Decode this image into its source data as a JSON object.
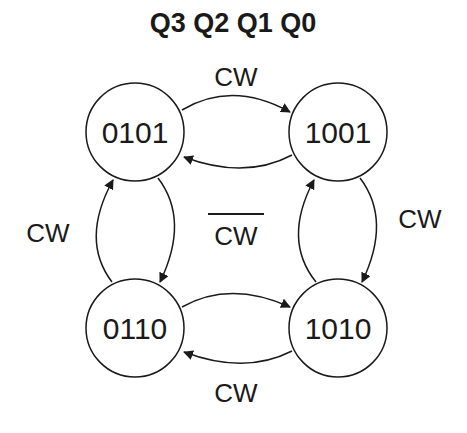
{
  "title": "Q3 Q2 Q1 Q0",
  "states": [
    {
      "id": "s0101",
      "label": "0101"
    },
    {
      "id": "s1001",
      "label": "1001"
    },
    {
      "id": "s0110",
      "label": "0110"
    },
    {
      "id": "s1010",
      "label": "1010"
    }
  ],
  "transitions": [
    {
      "from": "0101",
      "to": "1001",
      "label": "CW"
    },
    {
      "from": "1001",
      "to": "1010",
      "label": "CW"
    },
    {
      "from": "1010",
      "to": "0110",
      "label": "CW"
    },
    {
      "from": "0110",
      "to": "0101",
      "label": "CW"
    },
    {
      "from": "1001",
      "to": "0101",
      "label": "CW̅"
    },
    {
      "from": "0101",
      "to": "0110",
      "label": "CW̅"
    },
    {
      "from": "0110",
      "to": "1010",
      "label": "CW̅"
    },
    {
      "from": "1010",
      "to": "1001",
      "label": "CW̅"
    }
  ],
  "labels": {
    "top": "CW",
    "right": "CW",
    "bottom": "CW",
    "left": "CW",
    "center": "CW",
    "center_overbar": true
  },
  "colors": {
    "stroke": "#1a1a1a",
    "background": "#ffffff"
  }
}
